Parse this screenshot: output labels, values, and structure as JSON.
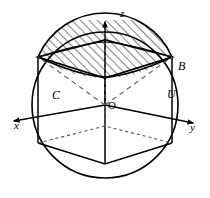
{
  "figure": {
    "axes": {
      "z_label": "z",
      "x_label": "x",
      "y_label": "y",
      "origin_label": "O"
    },
    "points": {
      "b_label": "B",
      "c_label": "C",
      "u_label": "U"
    },
    "style": {
      "stroke_color": "#000000",
      "hatch_color": "#1a1a1a",
      "background": "#ffffff",
      "dash_color": "#555555"
    }
  }
}
